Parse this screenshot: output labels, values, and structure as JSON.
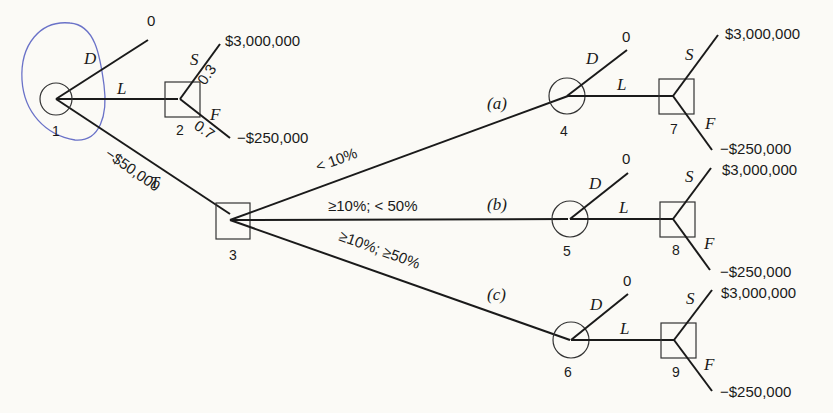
{
  "diagram": {
    "type": "decision-tree",
    "nodes": {
      "n1": {
        "id": "1",
        "kind": "decision-circle"
      },
      "n2": {
        "id": "2",
        "kind": "chance-square"
      },
      "n3": {
        "id": "3",
        "kind": "chance-square"
      },
      "n4": {
        "id": "4",
        "kind": "decision-circle"
      },
      "n5": {
        "id": "5",
        "kind": "decision-circle"
      },
      "n6": {
        "id": "6",
        "kind": "decision-circle"
      },
      "n7": {
        "id": "7",
        "kind": "chance-square"
      },
      "n8": {
        "id": "8",
        "kind": "chance-square"
      },
      "n9": {
        "id": "9",
        "kind": "chance-square"
      }
    },
    "edges": {
      "drop": "D",
      "launch": "L",
      "test": "T",
      "success": "S",
      "failure": "F",
      "test_cost": "−$50,000",
      "p_success": "0.3",
      "p_failure": "0.7",
      "branch_a": "< 10%",
      "branch_b": "≥10%; < 50%",
      "branch_c": "≥10%; ≥50%",
      "tag_a": "(a)",
      "tag_b": "(b)",
      "tag_c": "(c)"
    },
    "payoffs": {
      "drop": "0",
      "success": "$3,000,000",
      "failure": "−$250,000"
    },
    "annotation": {
      "highlight_node": "1",
      "color": "#6a72c8"
    }
  }
}
